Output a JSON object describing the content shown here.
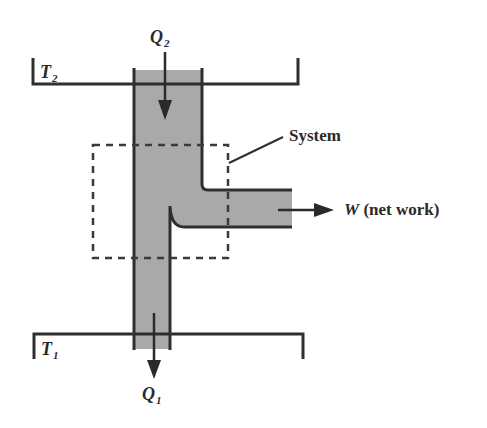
{
  "figure": {
    "colors": {
      "background": "#ffffff",
      "line": "#2f2f2f",
      "fluid_fill": "#a9a9a9",
      "text": "#2a2a2a"
    }
  },
  "labels": {
    "hot_reservoir": {
      "symbol": "T",
      "subscript": "2"
    },
    "cold_reservoir": {
      "symbol": "T",
      "subscript": "1"
    },
    "heat_in": {
      "symbol": "Q",
      "subscript": "2"
    },
    "heat_out": {
      "symbol": "Q",
      "subscript": "1"
    },
    "system": "System",
    "work": {
      "symbol": "W",
      "text": " (net work)"
    }
  },
  "icons": {
    "heat_in_arrow": "arrow-down",
    "heat_out_arrow": "arrow-down",
    "work_arrow": "arrow-right"
  }
}
